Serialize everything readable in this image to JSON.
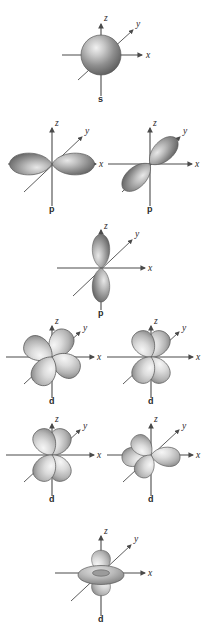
{
  "figure": {
    "background_color": "#ffffff",
    "ink_color": "#4a4a4a",
    "label_color": "#2b2b2b",
    "lobe_fill_light": "#e3e3e3",
    "lobe_fill_mid": "#bdbdbd",
    "lobe_fill_dark": "#7d7d7d",
    "axis_labels": {
      "x": "x",
      "y": "y",
      "z": "z"
    }
  },
  "orbitals": [
    {
      "id": "s",
      "label": "s",
      "row": 1,
      "column": "center",
      "shape": "sphere",
      "center": {
        "x": 101,
        "y": 55
      },
      "axis_labels": {
        "x": "x",
        "y": "y",
        "z": "z"
      }
    },
    {
      "id": "px",
      "label": "p",
      "row": 2,
      "column": "left",
      "shape": "two-lobe-horizontal",
      "center": {
        "x": 52,
        "y": 164
      },
      "axis_labels": {
        "x": "x",
        "y": "y",
        "z": "z"
      }
    },
    {
      "id": "py",
      "label": "p",
      "row": 2,
      "column": "right",
      "shape": "two-lobe-diagonal",
      "center": {
        "x": 150,
        "y": 164
      },
      "axis_labels": {
        "x": "x",
        "y": "y",
        "z": "z"
      }
    },
    {
      "id": "pz",
      "label": "p",
      "row": 3,
      "column": "center",
      "shape": "two-lobe-vertical",
      "center": {
        "x": 101,
        "y": 268
      },
      "axis_labels": {
        "x": "x",
        "y": "y",
        "z": "z"
      }
    },
    {
      "id": "dxy",
      "label": "d",
      "row": 4,
      "column": "left",
      "shape": "four-lobe-rotated",
      "center": {
        "x": 52,
        "y": 357
      },
      "axis_labels": {
        "x": "x",
        "y": "y",
        "z": "z"
      }
    },
    {
      "id": "dxz",
      "label": "d",
      "row": 4,
      "column": "right",
      "shape": "four-lobe-cross",
      "center": {
        "x": 151,
        "y": 357
      },
      "axis_labels": {
        "x": "x",
        "y": "y",
        "z": "z"
      }
    },
    {
      "id": "dyz",
      "label": "d",
      "row": 5,
      "column": "left",
      "shape": "four-lobe-cross",
      "center": {
        "x": 52,
        "y": 455
      },
      "axis_labels": {
        "x": "x",
        "y": "y",
        "z": "z"
      }
    },
    {
      "id": "dx2y2",
      "label": "d",
      "row": 5,
      "column": "right",
      "shape": "four-lobe-flat",
      "center": {
        "x": 151,
        "y": 455
      },
      "axis_labels": {
        "x": "x",
        "y": "y",
        "z": "z"
      }
    },
    {
      "id": "dz2",
      "label": "d",
      "row": 6,
      "column": "center",
      "shape": "two-lobe-vertical-with-torus",
      "center": {
        "x": 101,
        "y": 573
      },
      "axis_labels": {
        "x": "x",
        "y": "y",
        "z": "z"
      }
    }
  ]
}
